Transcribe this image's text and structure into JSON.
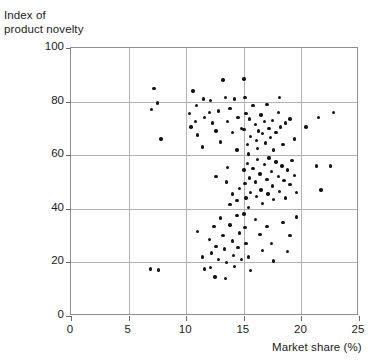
{
  "figure": {
    "y_axis_label": "Index of\nproduct novelty",
    "x_axis_label": "Market share (%)"
  },
  "chart_data": {
    "type": "scatter",
    "title": "",
    "xlabel": "Market share (%)",
    "ylabel": "Index of product novelty",
    "xlim": [
      0,
      25
    ],
    "ylim": [
      0,
      100
    ],
    "xticks": [
      0,
      5,
      10,
      15,
      20,
      25
    ],
    "yticks": [
      0,
      20,
      40,
      60,
      80,
      100
    ],
    "grid": true,
    "legend": null,
    "marker": "filled-circle",
    "marker_color": "#141414",
    "grid_color": "#b2b2b2",
    "frame_color": "#8f8f8f",
    "n_points": 133,
    "points": [
      [
        7.2,
        85.0
      ],
      [
        7.5,
        79.5
      ],
      [
        7.0,
        77.0
      ],
      [
        7.8,
        66.0
      ],
      [
        6.9,
        17.5
      ],
      [
        7.6,
        17.2
      ],
      [
        10.6,
        84.0
      ],
      [
        10.3,
        75.5
      ],
      [
        10.8,
        72.5
      ],
      [
        10.4,
        70.5
      ],
      [
        10.9,
        78.5
      ],
      [
        11.5,
        81.0
      ],
      [
        11.0,
        67.5
      ],
      [
        11.6,
        74.0
      ],
      [
        11.4,
        63.0
      ],
      [
        12.1,
        80.5
      ],
      [
        12.3,
        72.0
      ],
      [
        12.6,
        69.0
      ],
      [
        12.0,
        76.0
      ],
      [
        12.8,
        76.5
      ],
      [
        13.2,
        88.0
      ],
      [
        13.4,
        81.5
      ],
      [
        13.0,
        65.0
      ],
      [
        13.6,
        72.5
      ],
      [
        13.8,
        77.5
      ],
      [
        14.2,
        81.0
      ],
      [
        14.0,
        68.5
      ],
      [
        14.5,
        74.0
      ],
      [
        14.4,
        62.0
      ],
      [
        14.8,
        70.0
      ],
      [
        15.0,
        88.5
      ],
      [
        15.1,
        81.5
      ],
      [
        15.2,
        75.5
      ],
      [
        15.0,
        69.5
      ],
      [
        15.3,
        64.0
      ],
      [
        15.5,
        73.5
      ],
      [
        15.6,
        67.0
      ],
      [
        15.4,
        60.5
      ],
      [
        15.8,
        78.5
      ],
      [
        16.0,
        71.5
      ],
      [
        16.1,
        65.5
      ],
      [
        16.3,
        69.0
      ],
      [
        16.2,
        62.5
      ],
      [
        16.5,
        75.0
      ],
      [
        16.6,
        68.0
      ],
      [
        16.8,
        72.5
      ],
      [
        16.9,
        64.5
      ],
      [
        17.0,
        79.0
      ],
      [
        17.2,
        70.0
      ],
      [
        17.3,
        66.5
      ],
      [
        17.5,
        73.0
      ],
      [
        17.6,
        62.0
      ],
      [
        17.8,
        68.5
      ],
      [
        18.0,
        76.0
      ],
      [
        18.2,
        70.5
      ],
      [
        18.4,
        64.0
      ],
      [
        18.1,
        81.5
      ],
      [
        18.6,
        72.0
      ],
      [
        19.0,
        73.5
      ],
      [
        19.4,
        66.0
      ],
      [
        20.4,
        70.5
      ],
      [
        21.5,
        74.0
      ],
      [
        22.8,
        76.0
      ],
      [
        12.6,
        52.0
      ],
      [
        13.6,
        55.5
      ],
      [
        13.5,
        50.0
      ],
      [
        14.0,
        45.5
      ],
      [
        13.8,
        41.5
      ],
      [
        14.6,
        47.5
      ],
      [
        14.4,
        43.0
      ],
      [
        15.0,
        54.5
      ],
      [
        15.1,
        49.5
      ],
      [
        15.2,
        44.0
      ],
      [
        15.3,
        57.0
      ],
      [
        15.5,
        51.5
      ],
      [
        15.6,
        46.0
      ],
      [
        15.4,
        40.5
      ],
      [
        15.8,
        55.0
      ],
      [
        16.0,
        50.0
      ],
      [
        16.1,
        44.5
      ],
      [
        16.2,
        58.5
      ],
      [
        16.4,
        53.0
      ],
      [
        16.5,
        47.0
      ],
      [
        16.6,
        42.0
      ],
      [
        16.8,
        56.5
      ],
      [
        17.0,
        51.0
      ],
      [
        17.1,
        45.5
      ],
      [
        17.2,
        59.0
      ],
      [
        17.4,
        54.0
      ],
      [
        17.5,
        48.5
      ],
      [
        17.6,
        43.5
      ],
      [
        17.8,
        57.5
      ],
      [
        18.0,
        52.0
      ],
      [
        18.1,
        46.5
      ],
      [
        18.3,
        56.0
      ],
      [
        18.5,
        50.5
      ],
      [
        18.6,
        44.0
      ],
      [
        18.8,
        54.5
      ],
      [
        19.0,
        49.0
      ],
      [
        19.2,
        58.0
      ],
      [
        19.4,
        52.5
      ],
      [
        19.6,
        46.0
      ],
      [
        21.3,
        56.0
      ],
      [
        22.5,
        56.0
      ],
      [
        21.7,
        47.0
      ],
      [
        11.0,
        31.5
      ],
      [
        11.4,
        22.0
      ],
      [
        11.6,
        17.5
      ],
      [
        12.0,
        28.5
      ],
      [
        12.2,
        23.5
      ],
      [
        12.1,
        18.0
      ],
      [
        12.4,
        33.5
      ],
      [
        12.6,
        26.0
      ],
      [
        12.8,
        21.0
      ],
      [
        12.5,
        14.5
      ],
      [
        13.0,
        36.5
      ],
      [
        13.2,
        30.0
      ],
      [
        13.3,
        25.0
      ],
      [
        13.5,
        20.0
      ],
      [
        13.4,
        14.0
      ],
      [
        13.8,
        34.0
      ],
      [
        14.0,
        28.0
      ],
      [
        14.1,
        22.5
      ],
      [
        14.2,
        18.5
      ],
      [
        14.4,
        37.5
      ],
      [
        14.6,
        31.0
      ],
      [
        14.5,
        25.5
      ],
      [
        14.8,
        21.0
      ],
      [
        15.0,
        38.0
      ],
      [
        15.1,
        33.0
      ],
      [
        15.2,
        27.0
      ],
      [
        15.4,
        22.0
      ],
      [
        15.6,
        17.0
      ],
      [
        16.0,
        36.0
      ],
      [
        16.4,
        30.5
      ],
      [
        16.6,
        24.5
      ],
      [
        17.0,
        33.5
      ],
      [
        17.4,
        27.0
      ],
      [
        17.6,
        20.5
      ],
      [
        18.4,
        35.0
      ],
      [
        19.0,
        30.0
      ],
      [
        18.8,
        24.0
      ],
      [
        19.6,
        37.0
      ]
    ]
  }
}
